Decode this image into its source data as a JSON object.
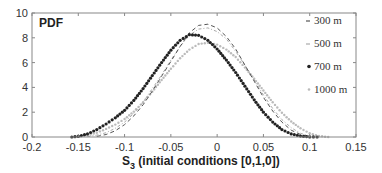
{
  "chart_data": {
    "type": "line",
    "title": "",
    "panel_label": "PDF",
    "xlabel": "S",
    "xlabel_subscript": "3",
    "xlabel_suffix": " (initial conditions [0,1,0])",
    "ylabel": "",
    "xlim": [
      -0.2,
      0.15
    ],
    "ylim": [
      0,
      10
    ],
    "xticks": [
      -0.2,
      -0.15,
      -0.1,
      -0.05,
      0,
      0.05,
      0.1,
      0.15
    ],
    "xtick_labels": [
      "-0.2",
      "-0.15",
      "-0.1",
      "-0.05",
      "0",
      "0.05",
      "0.1",
      "0.15"
    ],
    "yticks": [
      0,
      2,
      4,
      6,
      8,
      10
    ],
    "ytick_labels": [
      "0",
      "2",
      "4",
      "6",
      "8",
      "10"
    ],
    "grid": false,
    "legend_position": "upper right (inside)",
    "series": [
      {
        "name": "300 m",
        "style": "dashed",
        "color": "#555555",
        "peak_x": -0.018,
        "peak_y": 9.1,
        "x": [
          -0.13,
          -0.12,
          -0.11,
          -0.1,
          -0.09,
          -0.08,
          -0.07,
          -0.06,
          -0.05,
          -0.04,
          -0.03,
          -0.02,
          -0.01,
          0.0,
          0.01,
          0.02,
          0.03,
          0.04,
          0.05,
          0.06,
          0.07,
          0.08,
          0.09,
          0.1
        ],
        "y": [
          0.05,
          0.2,
          0.5,
          1.0,
          1.7,
          2.6,
          3.7,
          4.9,
          6.1,
          7.3,
          8.4,
          9.0,
          9.1,
          8.8,
          8.1,
          7.1,
          5.8,
          4.5,
          3.2,
          2.1,
          1.2,
          0.55,
          0.2,
          0.03
        ]
      },
      {
        "name": "500 m",
        "style": "dash-dot",
        "color": "#aaaaaa",
        "peak_x": -0.015,
        "peak_y": 8.8,
        "x": [
          -0.14,
          -0.13,
          -0.12,
          -0.11,
          -0.1,
          -0.09,
          -0.08,
          -0.07,
          -0.06,
          -0.05,
          -0.04,
          -0.03,
          -0.02,
          -0.01,
          0.0,
          0.01,
          0.02,
          0.03,
          0.04,
          0.05,
          0.06,
          0.07,
          0.08,
          0.09,
          0.1,
          0.11
        ],
        "y": [
          0.03,
          0.15,
          0.35,
          0.7,
          1.2,
          1.9,
          2.8,
          3.9,
          5.0,
          6.2,
          7.3,
          8.2,
          8.7,
          8.8,
          8.5,
          7.9,
          6.9,
          5.8,
          4.6,
          3.4,
          2.3,
          1.4,
          0.75,
          0.3,
          0.08,
          0.01
        ]
      },
      {
        "name": "700 m",
        "style": "markers-filled",
        "color": "#222222",
        "peak_x": -0.027,
        "peak_y": 8.3,
        "x": [
          -0.157,
          -0.15,
          -0.14,
          -0.13,
          -0.12,
          -0.11,
          -0.1,
          -0.09,
          -0.08,
          -0.07,
          -0.06,
          -0.05,
          -0.04,
          -0.03,
          -0.02,
          -0.01,
          0.0,
          0.01,
          0.02,
          0.03,
          0.04,
          0.05,
          0.06,
          0.07,
          0.08,
          0.09,
          0.1,
          0.108
        ],
        "y": [
          0.0,
          0.05,
          0.25,
          0.6,
          1.05,
          1.55,
          2.15,
          2.95,
          3.9,
          4.95,
          6.0,
          7.0,
          7.8,
          8.25,
          8.2,
          7.8,
          7.1,
          6.2,
          5.2,
          4.1,
          3.0,
          2.0,
          1.2,
          0.6,
          0.25,
          0.07,
          0.01,
          0.0
        ]
      },
      {
        "name": "1000 m",
        "style": "markers-light",
        "color": "#bbbbbb",
        "peak_x": -0.02,
        "peak_y": 7.6,
        "x": [
          -0.155,
          -0.14,
          -0.13,
          -0.12,
          -0.11,
          -0.1,
          -0.09,
          -0.08,
          -0.07,
          -0.06,
          -0.05,
          -0.04,
          -0.03,
          -0.02,
          -0.01,
          0.0,
          0.01,
          0.02,
          0.03,
          0.04,
          0.05,
          0.06,
          0.07,
          0.08,
          0.09,
          0.1,
          0.11,
          0.12
        ],
        "y": [
          0.0,
          0.12,
          0.35,
          0.65,
          1.0,
          1.45,
          2.05,
          2.8,
          3.65,
          4.6,
          5.5,
          6.35,
          7.05,
          7.5,
          7.6,
          7.45,
          7.05,
          6.45,
          5.6,
          4.7,
          3.75,
          2.8,
          1.95,
          1.25,
          0.7,
          0.3,
          0.08,
          0.0
        ]
      }
    ]
  }
}
